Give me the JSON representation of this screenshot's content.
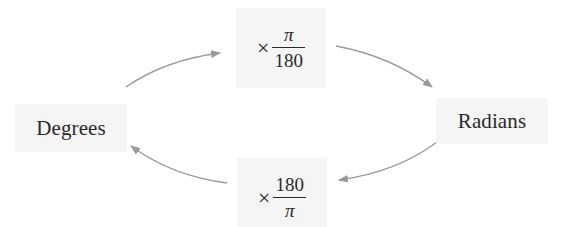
{
  "diagram": {
    "nodes": {
      "degrees": {
        "label": "Degrees"
      },
      "radians": {
        "label": "Radians"
      },
      "to_radians": {
        "operator": "×",
        "numerator": "π",
        "denominator": "180"
      },
      "to_degrees": {
        "operator": "×",
        "numerator": "180",
        "denominator": "π"
      }
    },
    "edges": [
      {
        "from": "Degrees",
        "to": "× π/180"
      },
      {
        "from": "× π/180",
        "to": "Radians"
      },
      {
        "from": "Radians",
        "to": "× 180/π"
      },
      {
        "from": "× 180/π",
        "to": "Degrees"
      }
    ],
    "colors": {
      "node_background": "#f5f5f5",
      "text": "#2a2a2a",
      "arrow": "#9a9a9a"
    }
  }
}
